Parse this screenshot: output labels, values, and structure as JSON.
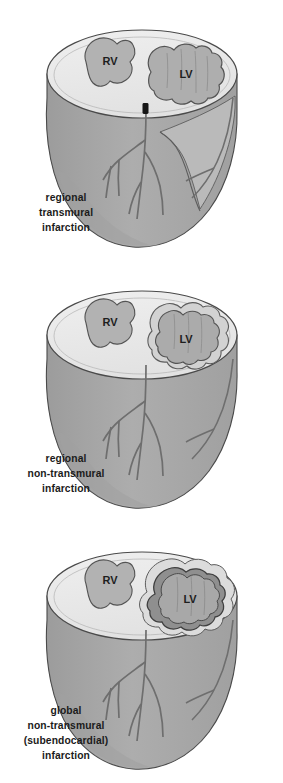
{
  "figure": {
    "background_color": "#ffffff",
    "palette": {
      "cut_surface": "#e9e9e9",
      "cut_surface_light": "#f1f1f1",
      "wall": "#a9a9a9",
      "wall_shadow": "#9a9a9a",
      "wall_light": "#b8b8b8",
      "chamber": "#b0b0b0",
      "infarct": "#9b9b9b",
      "infarct_dark": "#8d8d8d",
      "outline": "#4a4a4a",
      "artery": "#6e6e6e",
      "occlusion": "#1a1a1a",
      "text": "#1b1b1b"
    }
  },
  "panels": [
    {
      "id": "panel-1",
      "name": "regional-transmural-infarction",
      "caption_lines": [
        "regional",
        "transmural",
        "infarction"
      ],
      "chambers": [
        {
          "label": "RV",
          "name": "right-ventricle"
        },
        {
          "label": "LV",
          "name": "left-ventricle"
        }
      ],
      "features": {
        "infarct_type": "regional transmural",
        "artery_occluded": true,
        "occlusion_location": "proximal left anterior descending artery"
      }
    },
    {
      "id": "panel-2",
      "name": "regional-non-transmural-infarction",
      "caption_lines": [
        "regional",
        "non-transmural",
        "infarction"
      ],
      "chambers": [
        {
          "label": "RV",
          "name": "right-ventricle"
        },
        {
          "label": "LV",
          "name": "left-ventricle"
        }
      ],
      "features": {
        "infarct_type": "regional non-transmural",
        "artery_occluded": false,
        "occlusion_location": ""
      }
    },
    {
      "id": "panel-3",
      "name": "global-non-transmural-subendocardial-infarction",
      "caption_lines": [
        "global",
        "non-transmural",
        "(subendocardial)",
        "infarction"
      ],
      "chambers": [
        {
          "label": "RV",
          "name": "right-ventricle"
        },
        {
          "label": "LV",
          "name": "left-ventricle"
        }
      ],
      "features": {
        "infarct_type": "global non-transmural (subendocardial)",
        "artery_occluded": false,
        "occlusion_location": ""
      }
    }
  ]
}
